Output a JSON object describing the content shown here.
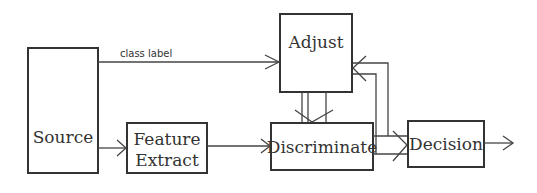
{
  "diagram": {
    "nodes": {
      "source": {
        "label": "Source"
      },
      "feature_extract": {
        "line1": "Feature",
        "line2": "Extract"
      },
      "adjust": {
        "label": "Adjust"
      },
      "discriminate": {
        "label": "Discriminate"
      },
      "decision": {
        "label": "Decision"
      }
    },
    "edges": {
      "class_label": {
        "label": "class label",
        "from": "Source",
        "to": "Adjust"
      },
      "source_to_feature": {
        "from": "Source",
        "to": "Feature Extract"
      },
      "feature_to_discriminate": {
        "from": "Feature Extract",
        "to": "Discriminate"
      },
      "adjust_to_discriminate": {
        "from": "Adjust",
        "to": "Discriminate",
        "count": 3
      },
      "discriminate_to_decision": {
        "from": "Discriminate",
        "to": "Decision",
        "count": 2
      },
      "feedback_to_adjust": {
        "from": "Discriminate/Decision",
        "to": "Adjust",
        "count": 2
      },
      "decision_output": {
        "from": "Decision",
        "to": "output"
      }
    },
    "colors": {
      "stroke": "#333333",
      "background": "#ffffff"
    }
  }
}
